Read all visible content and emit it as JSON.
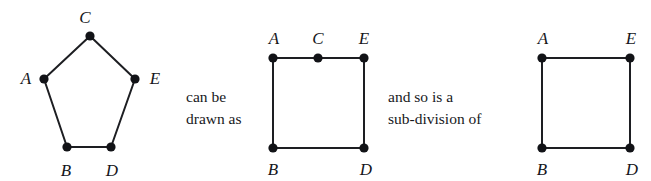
{
  "figure": {
    "caption_semantics": "A 5-cycle drawn as a pentagon equals a square with an extra degree-2 vertex, which is a sub-division of a 4-cycle square",
    "stroke_color": "#1d1e22",
    "vertex_color": "#121317",
    "background_color": "#ffffff",
    "stroke_width": 2,
    "vertex_radius": 4.6
  },
  "connectors": [
    {
      "name": "can-be-drawn-as",
      "line1": "can be",
      "line2": "drawn as",
      "x": 186,
      "y": 86
    },
    {
      "name": "and-so-is-a-sub-division-of",
      "line1": "and so is a",
      "line2": "sub-division of",
      "x": 388,
      "y": 86
    }
  ],
  "graphs": [
    {
      "name": "pentagon-graph",
      "shape": "pentagon",
      "vertices": [
        {
          "id": "C",
          "label": "C",
          "x": 90,
          "y": 36,
          "label_x": 85,
          "label_y": 17
        },
        {
          "id": "A",
          "label": "A",
          "x": 44,
          "y": 79,
          "label_x": 26,
          "label_y": 78
        },
        {
          "id": "E",
          "label": "E",
          "x": 135,
          "y": 79,
          "label_x": 155,
          "label_y": 78
        },
        {
          "id": "B",
          "label": "B",
          "x": 67,
          "y": 147,
          "label_x": 66,
          "label_y": 170
        },
        {
          "id": "D",
          "label": "D",
          "x": 111,
          "y": 147,
          "label_x": 112,
          "label_y": 170
        }
      ],
      "edges": [
        [
          "A",
          "C"
        ],
        [
          "C",
          "E"
        ],
        [
          "E",
          "D"
        ],
        [
          "D",
          "B"
        ],
        [
          "B",
          "A"
        ]
      ]
    },
    {
      "name": "square-with-subdivision-vertex-graph",
      "shape": "square-with-midpoint",
      "vertices": [
        {
          "id": "A",
          "label": "A",
          "x": 273,
          "y": 58,
          "label_x": 274,
          "label_y": 38
        },
        {
          "id": "C",
          "label": "C",
          "x": 318,
          "y": 58,
          "label_x": 318,
          "label_y": 38
        },
        {
          "id": "E",
          "label": "E",
          "x": 364,
          "y": 58,
          "label_x": 364,
          "label_y": 38
        },
        {
          "id": "B",
          "label": "B",
          "x": 273,
          "y": 148,
          "label_x": 273,
          "label_y": 169
        },
        {
          "id": "D",
          "label": "D",
          "x": 364,
          "y": 148,
          "label_x": 366,
          "label_y": 169
        }
      ],
      "edges": [
        [
          "A",
          "C"
        ],
        [
          "C",
          "E"
        ],
        [
          "E",
          "D"
        ],
        [
          "D",
          "B"
        ],
        [
          "B",
          "A"
        ]
      ]
    },
    {
      "name": "square-graph",
      "shape": "square",
      "vertices": [
        {
          "id": "A",
          "label": "A",
          "x": 542,
          "y": 58,
          "label_x": 543,
          "label_y": 38
        },
        {
          "id": "E",
          "label": "E",
          "x": 630,
          "y": 58,
          "label_x": 631,
          "label_y": 38
        },
        {
          "id": "B",
          "label": "B",
          "x": 542,
          "y": 148,
          "label_x": 542,
          "label_y": 169
        },
        {
          "id": "D",
          "label": "D",
          "x": 630,
          "y": 148,
          "label_x": 632,
          "label_y": 169
        }
      ],
      "edges": [
        [
          "A",
          "E"
        ],
        [
          "E",
          "D"
        ],
        [
          "D",
          "B"
        ],
        [
          "B",
          "A"
        ]
      ]
    }
  ]
}
